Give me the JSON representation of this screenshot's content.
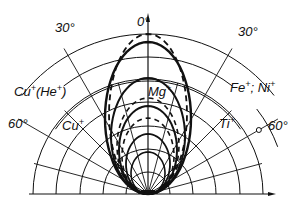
{
  "diagram": {
    "type": "polar angular distribution",
    "axis_top_label": "0°",
    "angle_labels": {
      "left_30": "30°",
      "right_30": "30°",
      "left_60": "60°",
      "right_60": "60°"
    },
    "species_labels": [
      {
        "id": "cu-he",
        "base": "Cu",
        "sup": "+",
        "mid": "(He",
        "sup2": "+",
        "end": ")"
      },
      {
        "id": "mg",
        "base": "Mg",
        "sup": "+"
      },
      {
        "id": "fe-ni",
        "base": "Fe",
        "sup": "+",
        "mid": "; Ni",
        "sup2": "+"
      },
      {
        "id": "cu",
        "base": "Cu",
        "sup": "+"
      },
      {
        "id": "ti",
        "base": "Ti",
        "sup": "+"
      }
    ],
    "colors": {
      "ink": "#111111",
      "background": "#ffffff"
    }
  }
}
